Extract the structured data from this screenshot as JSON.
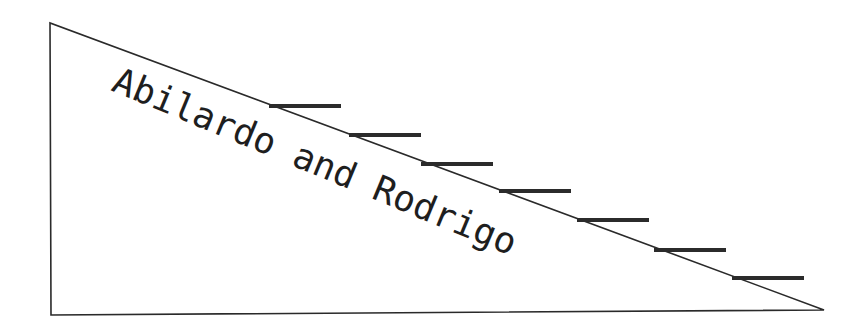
{
  "diagram": {
    "label": "Abilardo and Rodrigo",
    "colors": {
      "background": "#ffffff",
      "stroke": "#2a2a2a",
      "bar": "#2b2b2b",
      "text": "#1e1e1e"
    },
    "triangle": {
      "vertices": [
        [
          50,
          23
        ],
        [
          51,
          315
        ],
        [
          824,
          310
        ]
      ]
    },
    "steps": [
      {
        "x": 269,
        "y": 104,
        "width": 72,
        "height": 4
      },
      {
        "x": 349,
        "y": 133,
        "width": 72,
        "height": 4
      },
      {
        "x": 421,
        "y": 162,
        "width": 72,
        "height": 4
      },
      {
        "x": 499,
        "y": 189,
        "width": 72,
        "height": 4
      },
      {
        "x": 577,
        "y": 218,
        "width": 72,
        "height": 4
      },
      {
        "x": 654,
        "y": 248,
        "width": 72,
        "height": 4
      },
      {
        "x": 732,
        "y": 276,
        "width": 72,
        "height": 4
      }
    ]
  }
}
